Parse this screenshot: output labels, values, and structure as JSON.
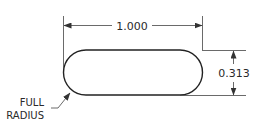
{
  "drawing": {
    "shape": "slot",
    "dimensions": {
      "width": {
        "label": "1.000"
      },
      "height": {
        "label": "0.313"
      }
    },
    "callout": {
      "line1": "FULL",
      "line2": "RADIUS"
    },
    "colors": {
      "line": "#222222",
      "thin_line": "#444444",
      "background": "#ffffff"
    }
  }
}
